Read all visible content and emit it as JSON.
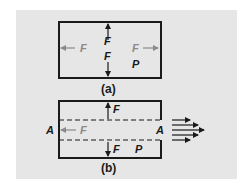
{
  "figure": {
    "panel_a": {
      "caption": "(a)",
      "labels": {
        "left_force": "F",
        "right_force": "F",
        "up_force": "F",
        "down_force": "F",
        "pressure": "P"
      }
    },
    "panel_b": {
      "caption": "(b)",
      "labels": {
        "left_area": "A",
        "right_area": "A",
        "left_force": "F",
        "up_force": "F",
        "down_force": "F",
        "pressure": "P"
      },
      "flow_arrows_count": 5
    },
    "colors": {
      "background": "#e6e6e6",
      "stroke": "#1a1a1a",
      "faint_label": "#8a8a8a"
    }
  }
}
